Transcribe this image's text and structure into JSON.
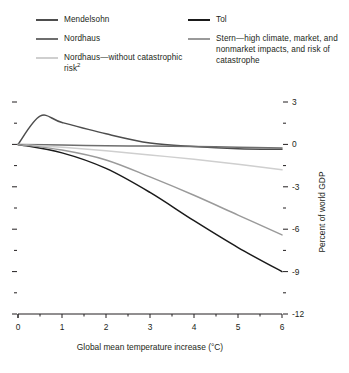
{
  "legend": {
    "columns": [
      {
        "items": [
          {
            "label": "Mendelsohn",
            "color": "#4d4d4d",
            "series": "mendelsohn"
          },
          {
            "label": "Nordhaus",
            "color": "#6e6e6e",
            "series": "nordhaus"
          },
          {
            "label": "Nordhaus—without catastrophic risk",
            "sup": "2",
            "color": "#cfcfcf",
            "series": "nordhaus_no_cat"
          }
        ]
      },
      {
        "items": [
          {
            "label": "Tol",
            "color": "#1a1a1a",
            "series": "tol"
          },
          {
            "label": "Stern—high climate, market, and nonmarket impacts, and risk of catastrophe",
            "color": "#9a9a9a",
            "series": "stern"
          }
        ]
      }
    ]
  },
  "axes": {
    "xlabel": "Global mean temperature increase (°C)",
    "ylabel": "Percent of world GDP",
    "x_ticks": [
      "0",
      "1",
      "2",
      "3",
      "4",
      "5",
      "6"
    ],
    "y_ticks": [
      "3",
      "0",
      "-3",
      "-6",
      "-9",
      "-12"
    ]
  },
  "chart_data": {
    "type": "line",
    "title": "",
    "xlabel": "Global mean temperature increase (°C)",
    "ylabel": "Percent of world GDP",
    "xlim": [
      0,
      6
    ],
    "ylim": [
      -12,
      3
    ],
    "x_ticks": [
      0,
      1,
      2,
      3,
      4,
      5,
      6
    ],
    "y_ticks": [
      3,
      0,
      -3,
      -6,
      -9,
      -12
    ],
    "x_minor_ticks": [
      0.5,
      1.5,
      2.5,
      3.5,
      4.5,
      5.5
    ],
    "y_minor_ticks": [
      1.5,
      -1.5,
      -4.5,
      -7.5,
      -10.5
    ],
    "grid": false,
    "legend_position": "above-plot",
    "series": [
      {
        "name": "Mendelsohn",
        "color": "#4d4d4d",
        "x": [
          0,
          0.5,
          1,
          2,
          3,
          4,
          5,
          6
        ],
        "values": [
          0,
          2.0,
          1.55,
          0.75,
          0.1,
          -0.15,
          -0.3,
          -0.35
        ]
      },
      {
        "name": "Nordhaus",
        "color": "#6e6e6e",
        "x": [
          0,
          1,
          2,
          3,
          4,
          5,
          6
        ],
        "values": [
          0,
          -0.05,
          -0.1,
          -0.12,
          -0.15,
          -0.2,
          -0.25
        ]
      },
      {
        "name": "Nordhaus—without catastrophic risk",
        "color": "#cfcfcf",
        "x": [
          0,
          1,
          2,
          3,
          4,
          5,
          6
        ],
        "values": [
          0,
          -0.2,
          -0.45,
          -0.75,
          -1.05,
          -1.4,
          -1.8
        ]
      },
      {
        "name": "Tol",
        "color": "#1a1a1a",
        "x": [
          0,
          1,
          2,
          3,
          4,
          5,
          6
        ],
        "values": [
          0,
          -0.6,
          -1.7,
          -3.4,
          -5.4,
          -7.3,
          -9.0
        ]
      },
      {
        "name": "Stern—high climate, market, and nonmarket impacts, and risk of catastrophe",
        "color": "#9a9a9a",
        "x": [
          0,
          1,
          2,
          3,
          4,
          5,
          6
        ],
        "values": [
          0,
          -0.4,
          -1.1,
          -2.3,
          -3.6,
          -5.0,
          -6.4
        ]
      }
    ]
  }
}
